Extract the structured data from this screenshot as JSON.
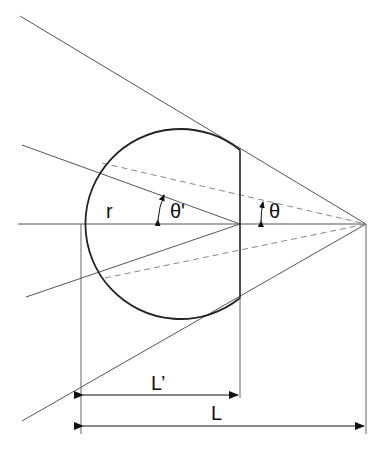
{
  "diagram": {
    "labels": {
      "radius": "r",
      "theta_prime": "θ'",
      "theta": "θ",
      "l_prime": "L’",
      "l": "L"
    },
    "colors": {
      "line": "#444444",
      "circle": "#222222",
      "dashed": "#777777",
      "background": "#ffffff"
    }
  }
}
